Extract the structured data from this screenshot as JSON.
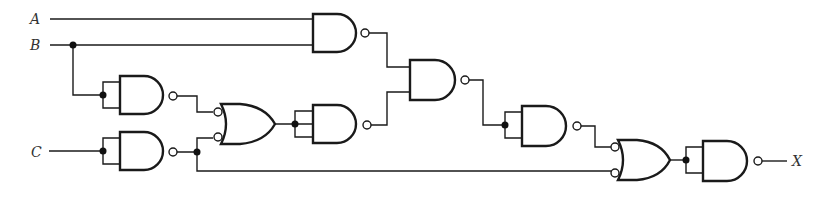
{
  "diagram": {
    "type": "logic-circuit",
    "inputs": [
      {
        "id": "A",
        "label": "A"
      },
      {
        "id": "B",
        "label": "B"
      },
      {
        "id": "C",
        "label": "C"
      }
    ],
    "output": {
      "id": "X",
      "label": "X"
    },
    "gates": [
      {
        "id": "G1",
        "type": "NAND",
        "inputs": [
          "A",
          "B"
        ]
      },
      {
        "id": "G2",
        "type": "NAND",
        "inputs": [
          "B",
          "B"
        ]
      },
      {
        "id": "G3",
        "type": "NAND",
        "inputs": [
          "C",
          "C"
        ]
      },
      {
        "id": "G4",
        "type": "OR (negated inputs)",
        "inputs": [
          "G2",
          "G3"
        ]
      },
      {
        "id": "G5",
        "type": "NAND",
        "inputs": [
          "G4",
          "G4"
        ]
      },
      {
        "id": "G6",
        "type": "NAND",
        "inputs": [
          "G1",
          "G5"
        ]
      },
      {
        "id": "G7",
        "type": "NAND",
        "inputs": [
          "G6",
          "G6"
        ]
      },
      {
        "id": "G8",
        "type": "OR (negated inputs)",
        "inputs": [
          "G7",
          "G3"
        ]
      },
      {
        "id": "G9",
        "type": "NAND",
        "inputs": [
          "G8",
          "G8"
        ]
      }
    ],
    "colors": {
      "line": "#1a1a1a",
      "label": "#333333",
      "background": "#ffffff"
    }
  }
}
